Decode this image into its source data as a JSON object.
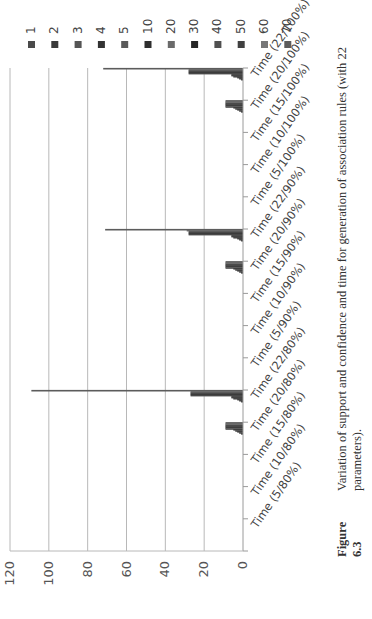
{
  "figure": {
    "number": "Figure 6.3",
    "caption": "Variation of support and confidence and time for generation of association rules (with 22 parameters)."
  },
  "chart_data": {
    "type": "bar",
    "title": "",
    "xlabel": "",
    "ylabel": "",
    "ylim": [
      0,
      120
    ],
    "yticks": [
      0,
      20,
      40,
      60,
      80,
      100,
      120
    ],
    "grid": true,
    "legend_position": "right",
    "categories": [
      "Time (5/80%)",
      "Time (10/80%)",
      "Time (15/80%)",
      "Time (20/80%)",
      "Time (22/80%)",
      "Time (5/90%)",
      "Time (10/90%)",
      "Time (15/90%)",
      "Time (20/90%)",
      "Time (22/90%)",
      "Time (5/100%)",
      "Time (10/100%)",
      "Time (15/100%)",
      "Time (20/100%)",
      "Time (22/100%)"
    ],
    "series": [
      {
        "name": "1",
        "color": "#4a4a4a",
        "values": [
          0,
          0,
          0,
          1,
          1,
          0,
          0,
          0,
          1,
          1,
          0,
          0,
          0,
          1,
          1
        ]
      },
      {
        "name": "2",
        "color": "#3a3a3a",
        "values": [
          0,
          0,
          0,
          2,
          2,
          0,
          0,
          0,
          2,
          2,
          0,
          0,
          0,
          2,
          2
        ]
      },
      {
        "name": "3",
        "color": "#555555",
        "values": [
          0,
          0,
          0,
          3,
          3,
          0,
          0,
          0,
          3,
          3,
          0,
          0,
          0,
          3,
          3
        ]
      },
      {
        "name": "4",
        "color": "#333333",
        "values": [
          0,
          0,
          0,
          4,
          5,
          0,
          0,
          0,
          4,
          5,
          0,
          0,
          0,
          4,
          5
        ]
      },
      {
        "name": "5",
        "color": "#5a5a5a",
        "values": [
          0,
          0,
          0,
          5,
          6,
          0,
          0,
          0,
          5,
          6,
          0,
          0,
          0,
          5,
          6
        ]
      },
      {
        "name": "10",
        "color": "#2e2e2e",
        "values": [
          0,
          0,
          0,
          9,
          6,
          0,
          0,
          0,
          9,
          6,
          0,
          0,
          0,
          9,
          6
        ]
      },
      {
        "name": "20",
        "color": "#6a6a6a",
        "values": [
          0,
          0,
          0,
          9,
          27,
          0,
          0,
          0,
          9,
          28,
          0,
          0,
          0,
          9,
          28
        ]
      },
      {
        "name": "30",
        "color": "#262626",
        "values": [
          0,
          0,
          0,
          9,
          27,
          0,
          0,
          0,
          9,
          28,
          0,
          0,
          0,
          9,
          28
        ]
      },
      {
        "name": "40",
        "color": "#505050",
        "values": [
          0,
          0,
          0,
          9,
          27,
          0,
          0,
          0,
          9,
          28,
          0,
          0,
          0,
          9,
          28
        ]
      },
      {
        "name": "50",
        "color": "#404040",
        "values": [
          0,
          0,
          0,
          9,
          27,
          0,
          0,
          0,
          9,
          28,
          0,
          0,
          0,
          9,
          28
        ]
      },
      {
        "name": "60",
        "color": "#777777",
        "values": [
          0,
          0,
          0,
          9,
          27,
          0,
          0,
          0,
          9,
          29,
          0,
          0,
          0,
          9,
          28
        ]
      },
      {
        "name": "70",
        "color": "#5c5c5c",
        "values": [
          0,
          0,
          0,
          9,
          109,
          0,
          0,
          0,
          9,
          71,
          0,
          0,
          0,
          9,
          72
        ]
      }
    ]
  }
}
